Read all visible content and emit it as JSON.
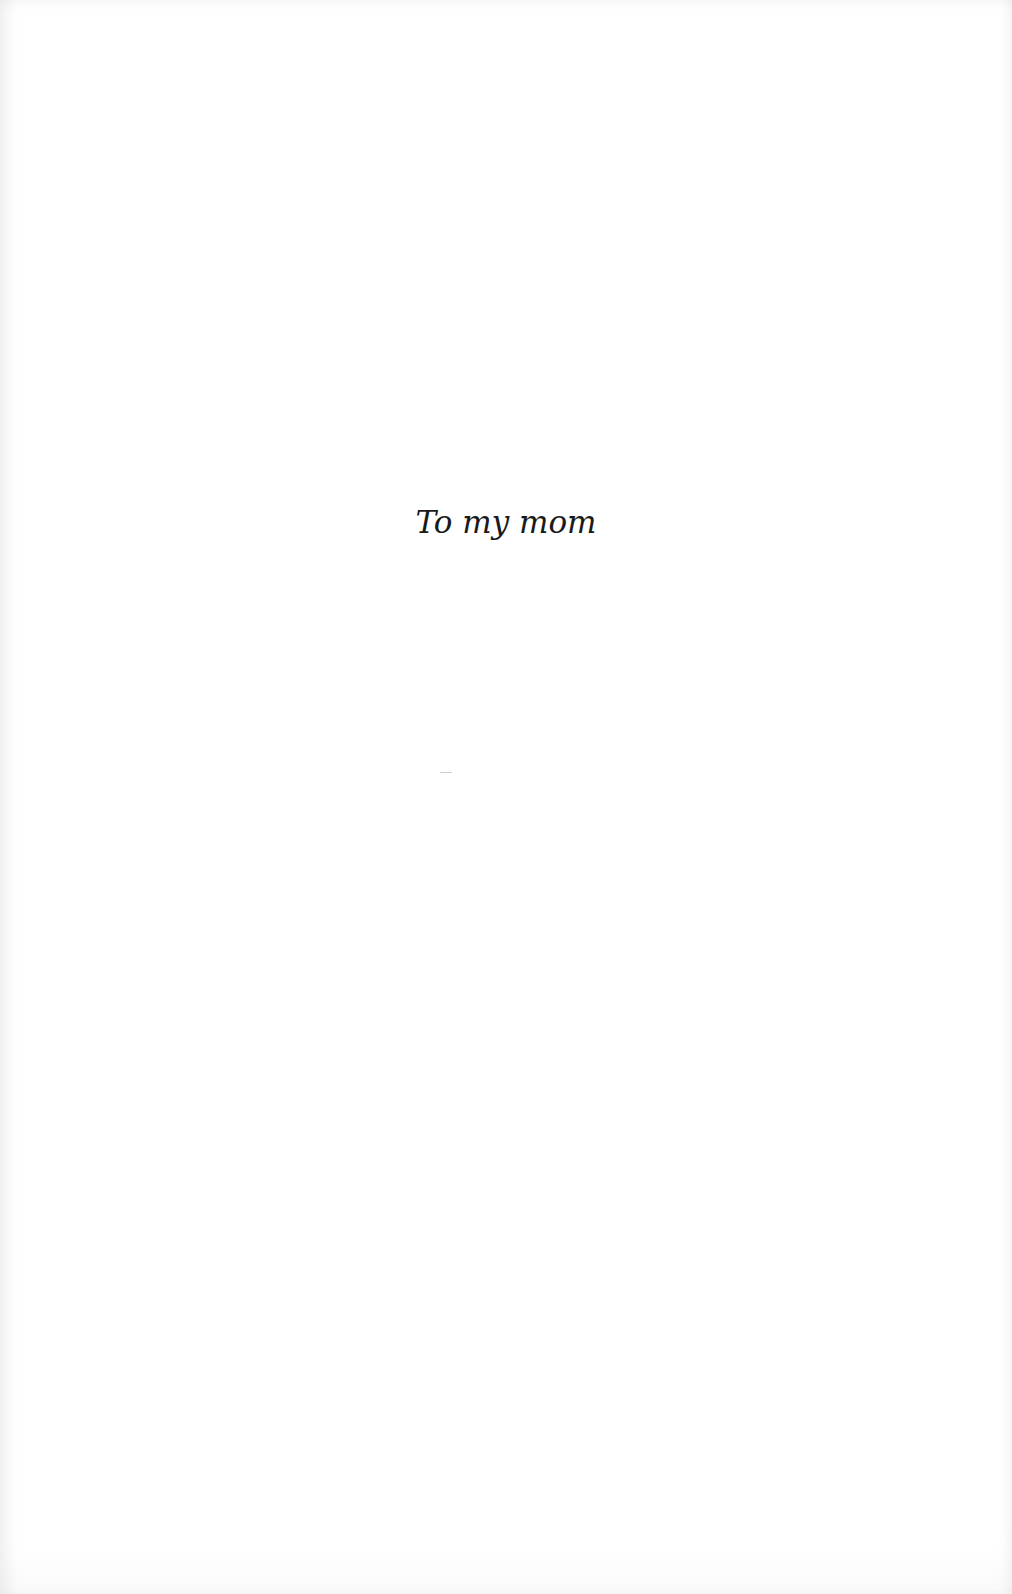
{
  "page": {
    "type": "dedication",
    "background_color": "#ffffff",
    "text_color": "#1a1a1a"
  },
  "dedication": {
    "text": "To my mom"
  }
}
